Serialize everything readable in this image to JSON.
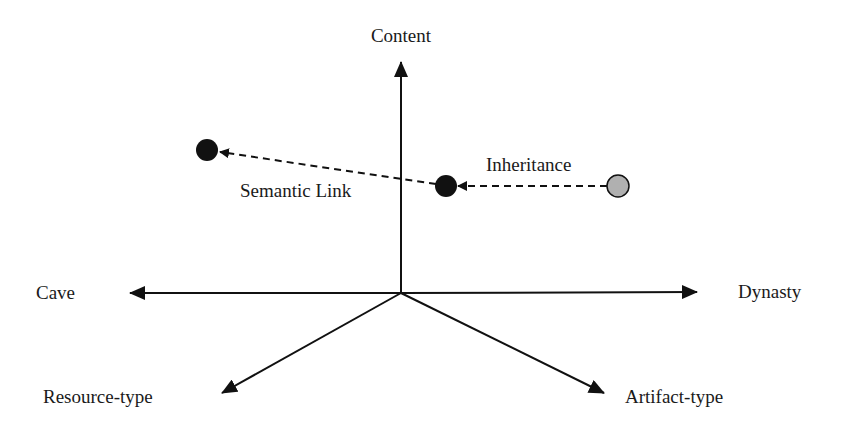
{
  "diagram": {
    "axes": {
      "content": "Content",
      "cave": "Cave",
      "dynasty": "Dynasty",
      "resource_type": "Resource-type",
      "artifact_type": "Artifact-type"
    },
    "links": {
      "semantic_link": "Semantic Link",
      "inheritance": "Inheritance"
    },
    "nodes": [
      {
        "id": "node-left",
        "color": "#111111"
      },
      {
        "id": "node-center",
        "color": "#111111"
      },
      {
        "id": "node-right",
        "color": "#b0b0b0"
      }
    ]
  }
}
